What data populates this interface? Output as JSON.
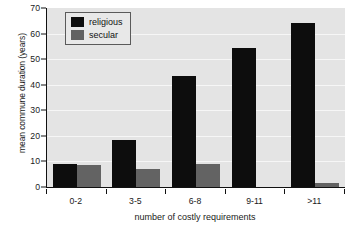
{
  "chart_data": {
    "type": "bar",
    "title": "",
    "xlabel": "number of costly requirements",
    "ylabel": "mean commune duration (years)",
    "categories": [
      "0-2",
      "3-5",
      "6-8",
      "9-11",
      ">11"
    ],
    "series": [
      {
        "name": "religious",
        "color": "#0d0d0d",
        "values": [
          9,
          18.5,
          43.5,
          54.5,
          64
        ]
      },
      {
        "name": "secular",
        "color": "#636363",
        "values": [
          8.5,
          7,
          9,
          0,
          1.5
        ]
      }
    ],
    "ylim": [
      0,
      70
    ],
    "yticks": [
      0,
      10,
      20,
      30,
      40,
      50,
      60,
      70
    ],
    "grid": true,
    "grid_axis": "y",
    "legend_position": "top-left",
    "plot_background": "#e4e4e4",
    "figure_background": "#ffffff"
  }
}
